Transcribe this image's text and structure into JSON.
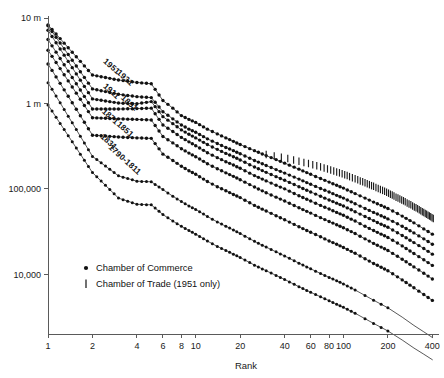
{
  "chart_data": {
    "type": "line",
    "title": "",
    "subtitle": "",
    "xlabel": "Rank",
    "ylabel": "",
    "xscale": "log",
    "yscale": "log",
    "xlim": [
      1,
      430
    ],
    "ylim": [
      2000,
      10000000
    ],
    "grid": false,
    "legend_position": "inside-lower-left",
    "x_ticks": [
      {
        "value": 1,
        "label": "1"
      },
      {
        "value": 2,
        "label": "2"
      },
      {
        "value": 4,
        "label": "4"
      },
      {
        "value": 6,
        "label": "6"
      },
      {
        "value": 8,
        "label": "8"
      },
      {
        "value": 10,
        "label": "10"
      },
      {
        "value": 20,
        "label": "20"
      },
      {
        "value": 40,
        "label": "40"
      },
      {
        "value": 60,
        "label": "60"
      },
      {
        "value": 80,
        "label": "80"
      },
      {
        "value": 100,
        "label": "100"
      },
      {
        "value": 200,
        "label": "200"
      },
      {
        "value": 400,
        "label": "400"
      }
    ],
    "y_ticks": [
      {
        "value": 10000000,
        "label": "10 m"
      },
      {
        "value": 1000000,
        "label": "1 m"
      },
      {
        "value": 100000,
        "label": "100,000"
      },
      {
        "value": 10000,
        "label": "10,000"
      }
    ],
    "legend": [
      {
        "label": "Chamber of Commerce",
        "marker": "dot"
      },
      {
        "label": "Chamber of Trade (1951 only)",
        "marker": "vertical-bar"
      }
    ],
    "series": [
      {
        "name": "1951",
        "label": "1951",
        "marker": "dot",
        "label_anchor": {
          "rank": 2.35,
          "value": 3050000
        },
        "x": [
          1,
          2,
          3,
          4,
          5,
          6,
          7,
          8,
          9,
          10,
          12,
          14,
          16,
          18,
          20,
          25,
          30,
          35,
          40,
          50,
          60,
          70,
          80,
          90,
          100,
          120,
          140,
          160,
          180,
          200,
          250,
          300,
          350,
          400
        ],
        "values": [
          8300000,
          2150000,
          1880000,
          1760000,
          1700000,
          1080000,
          880000,
          720000,
          650000,
          600000,
          500000,
          440000,
          395000,
          360000,
          330000,
          280000,
          245000,
          220000,
          200000,
          170000,
          148000,
          132000,
          120000,
          110000,
          102000,
          88000,
          78000,
          70000,
          64000,
          59000,
          48000,
          40000,
          34000,
          29500
        ]
      },
      {
        "name": "1931",
        "label": "1931",
        "marker": "dot",
        "label_anchor": {
          "rank": 2.9,
          "value": 2250000
        },
        "x": [
          1,
          2,
          3,
          4,
          5,
          6,
          7,
          8,
          9,
          10,
          12,
          14,
          16,
          18,
          20,
          25,
          30,
          35,
          40,
          50,
          60,
          70,
          80,
          90,
          100,
          120,
          140,
          160,
          180,
          200,
          250,
          300,
          350,
          400
        ],
        "values": [
          8100000,
          1480000,
          1280000,
          1200000,
          1170000,
          800000,
          660000,
          560000,
          500000,
          460000,
          385000,
          340000,
          305000,
          280000,
          258000,
          215000,
          188000,
          168000,
          153000,
          130000,
          113000,
          101000,
          92000,
          84000,
          78000,
          67000,
          59000,
          53000,
          48500,
          44500,
          36500,
          30500,
          26000,
          22500
        ]
      },
      {
        "name": "1911",
        "label": "1911",
        "marker": "dot",
        "label_anchor": {
          "rank": 2.35,
          "value": 1560000
        },
        "x": [
          1,
          2,
          3,
          4,
          5,
          6,
          7,
          8,
          9,
          10,
          12,
          14,
          16,
          18,
          20,
          25,
          30,
          35,
          40,
          50,
          60,
          70,
          80,
          90,
          100,
          120,
          140,
          160,
          180,
          200,
          250,
          300,
          350,
          400
        ],
        "values": [
          7200000,
          1130000,
          1010000,
          990000,
          1050000,
          700000,
          580000,
          490000,
          435000,
          395000,
          330000,
          290000,
          260000,
          238000,
          218000,
          180000,
          156000,
          139000,
          126000,
          106000,
          92000,
          82000,
          74000,
          68000,
          63000,
          54000,
          47500,
          42500,
          38500,
          35500,
          28500,
          23500,
          20000,
          17200
        ]
      },
      {
        "name": "1891",
        "label": "1891",
        "marker": "dot",
        "label_anchor": {
          "rank": 3.1,
          "value": 1140000
        },
        "x": [
          1,
          2,
          3,
          4,
          5,
          6,
          7,
          8,
          9,
          10,
          12,
          14,
          16,
          18,
          20,
          25,
          30,
          35,
          40,
          50,
          60,
          70,
          80,
          90,
          100,
          120,
          140,
          160,
          180,
          200,
          250,
          300,
          350,
          400
        ],
        "values": [
          5600000,
          860000,
          860000,
          870000,
          880000,
          560000,
          470000,
          400000,
          355000,
          320000,
          265000,
          232000,
          208000,
          190000,
          174000,
          143000,
          124000,
          110000,
          100000,
          83000,
          72000,
          64000,
          58000,
          53000,
          49000,
          42000,
          36500,
          32500,
          29500,
          27000,
          21500,
          17500,
          14800,
          12700
        ]
      },
      {
        "name": "1871",
        "label": "1871",
        "marker": "dot",
        "label_anchor": {
          "rank": 2.3,
          "value": 790000
        },
        "x": [
          1,
          2,
          3,
          4,
          5,
          6,
          7,
          8,
          9,
          10,
          12,
          14,
          16,
          18,
          20,
          25,
          30,
          35,
          40,
          50,
          60,
          70,
          80,
          90,
          100,
          120,
          140,
          160,
          180,
          200,
          250,
          300,
          350,
          400
        ],
        "values": [
          4200000,
          680000,
          660000,
          650000,
          640000,
          410000,
          345000,
          295000,
          262000,
          238000,
          197000,
          172000,
          154000,
          140000,
          128000,
          105000,
          90000,
          80000,
          72000,
          60000,
          52000,
          46000,
          41500,
          38000,
          35000,
          30000,
          26000,
          23000,
          20800,
          19000,
          15000,
          12200,
          10300,
          8800
        ]
      },
      {
        "name": "1851",
        "label": "1851",
        "marker": "dot",
        "label_anchor": {
          "rank": 2.9,
          "value": 560000
        },
        "x": [
          1,
          2,
          3,
          4,
          5,
          6,
          7,
          8,
          9,
          10,
          12,
          14,
          16,
          18,
          20,
          25,
          30,
          35,
          40,
          50,
          60,
          70,
          80,
          90,
          100,
          120,
          140,
          160,
          180,
          200,
          250,
          300,
          350,
          400
        ],
        "values": [
          2900000,
          425000,
          405000,
          395000,
          390000,
          255000,
          215000,
          184000,
          163000,
          148000,
          122000,
          106000,
          95000,
          86000,
          79000,
          64000,
          55000,
          48500,
          43500,
          36000,
          31000,
          27500,
          24500,
          22500,
          20600,
          17600,
          15200,
          13400,
          12100,
          11000,
          8600,
          6950,
          5800,
          4950
        ]
      },
      {
        "name": "1831",
        "label": "1831",
        "marker": "dot",
        "label_anchor": {
          "rank": 2.25,
          "value": 400000
        },
        "x": [
          1,
          2,
          3,
          4,
          5,
          6,
          7,
          8,
          9,
          10,
          12,
          14,
          16,
          18,
          20,
          25,
          30,
          35,
          40,
          50,
          60,
          70,
          80,
          90,
          100,
          120,
          140,
          160,
          180,
          200,
          250,
          300,
          350,
          400
        ],
        "values": [
          1750000,
          240000,
          142000,
          123000,
          121000,
          98000,
          82000,
          71000,
          63000,
          57500,
          47500,
          41000,
          36500,
          33000,
          30000,
          24300,
          20800,
          18300,
          16400,
          13500,
          11600,
          10200,
          9200,
          8400,
          7700,
          6550,
          5650,
          4970,
          4460,
          4050,
          3150,
          2520,
          2120,
          1820
        ]
      },
      {
        "name": "1790-1811",
        "label": "1790-1811",
        "marker": "dot",
        "label_anchor": {
          "rank": 2.55,
          "value": 300000
        },
        "x": [
          1,
          2,
          3,
          4,
          5,
          6,
          7,
          8,
          9,
          10,
          12,
          14,
          16,
          18,
          20,
          25,
          30,
          35,
          40,
          50,
          60,
          70,
          80,
          90,
          100,
          120,
          140,
          160,
          180,
          200,
          250,
          300,
          350,
          400
        ],
        "values": [
          960000,
          155000,
          78000,
          66000,
          65000,
          50000,
          42000,
          36500,
          32500,
          29500,
          24500,
          21200,
          19000,
          17200,
          15700,
          12800,
          11000,
          9700,
          8700,
          7150,
          6150,
          5450,
          4900,
          4450,
          4100,
          3500,
          3020,
          2660,
          2390,
          2170,
          1700,
          1370,
          1160,
          1000
        ]
      }
    ],
    "trade_ticks": {
      "note": "Chamber of Trade 1951-only localities, drawn as short vertical bars",
      "x": [
        30,
        34,
        38,
        42,
        46,
        50,
        54,
        58,
        62,
        66,
        70,
        74,
        78,
        82,
        86,
        90,
        94,
        98,
        102,
        106,
        110,
        115,
        120,
        125,
        130,
        135,
        140,
        145,
        150,
        155,
        160,
        166,
        172,
        178,
        184,
        190,
        196,
        202,
        208,
        214,
        220,
        227,
        234,
        241,
        248,
        255,
        262,
        270,
        278,
        286,
        294,
        302,
        310,
        318,
        326,
        334,
        342,
        350,
        358,
        366,
        374,
        382,
        390,
        398,
        406
      ],
      "values": [
        252000,
        243000,
        234000,
        226000,
        218000,
        211000,
        204000,
        198000,
        192000,
        186000,
        181000,
        176000,
        171000,
        166000,
        162000,
        158000,
        154000,
        150000,
        146000,
        143000,
        139000,
        135000,
        131000,
        128000,
        124000,
        121000,
        118000,
        115000,
        112000,
        109000,
        107000,
        104000,
        101000,
        98500,
        96000,
        93500,
        91000,
        89000,
        86500,
        84500,
        82500,
        80000,
        78000,
        76000,
        74000,
        72500,
        70500,
        68500,
        66500,
        65000,
        63000,
        61500,
        60000,
        58500,
        57000,
        55500,
        54000,
        53000,
        51500,
        50500,
        49000,
        48000,
        47000,
        46000,
        45000
      ]
    }
  },
  "colors": {
    "axis": "#5a5a5a",
    "ink": "#111111",
    "background": "#ffffff"
  }
}
